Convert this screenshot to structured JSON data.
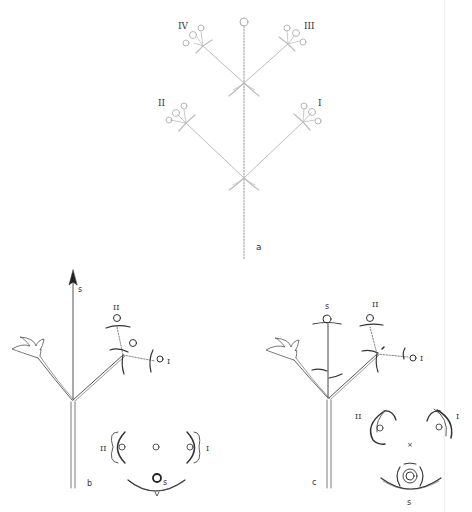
{
  "figure": {
    "panels": [
      {
        "id": "a",
        "label": "a",
        "description": "Inflorescence schematic with dotted main axis and four lateral branches",
        "branch_labels": {
          "I": "I",
          "II": "II",
          "III": "III",
          "IV": "IV"
        }
      },
      {
        "id": "b",
        "label": "b",
        "axis_label": "s",
        "branch_labels": {
          "I": "I",
          "II": "II"
        },
        "diagram_labels": {
          "left": "II",
          "right": "I",
          "bottom": "s"
        }
      },
      {
        "id": "c",
        "label": "c",
        "axis_label": "s",
        "branch_labels": {
          "I": "I",
          "II": "II"
        },
        "diagram_labels": {
          "left": "II",
          "right": "I",
          "bottom": "s",
          "center_mark": "×"
        }
      }
    ]
  }
}
